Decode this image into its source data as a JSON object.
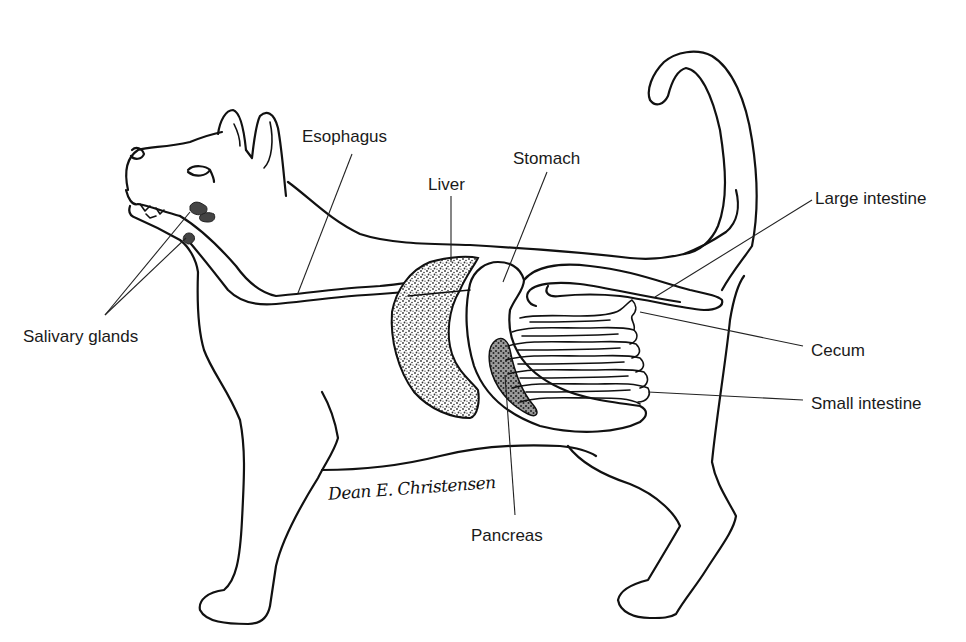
{
  "diagram": {
    "colors": {
      "line": "#111111",
      "background": "#ffffff",
      "liver_stipple": "#555555",
      "pancreas_stipple": "#444444",
      "gland": "#444444"
    },
    "labels": {
      "esophagus": "Esophagus",
      "stomach": "Stomach",
      "liver": "Liver",
      "large_intestine": "Large intestine",
      "salivary_glands": "Salivary glands",
      "cecum": "Cecum",
      "small_intestine": "Small intestine",
      "pancreas": "Pancreas"
    },
    "signature": "Dean E. Christensen"
  }
}
